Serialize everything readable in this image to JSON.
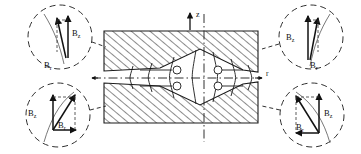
{
  "figure": {
    "axes": {
      "vertical_label": "z",
      "horizontal_label": "r"
    },
    "components": {
      "axial_label": "B",
      "axial_sub": "z",
      "radial_label": "B",
      "radial_sub": "r"
    },
    "callouts": [
      {
        "id": "top-left",
        "position": "upper-left pole tip",
        "axial_label": "B",
        "axial_sub": "z",
        "radial_label": "B",
        "radial_sub": "r"
      },
      {
        "id": "top-right",
        "position": "upper-right pole tip",
        "axial_label": "B",
        "axial_sub": "z",
        "radial_label": "B",
        "radial_sub": "r"
      },
      {
        "id": "bottom-left",
        "position": "lower-left pole tip",
        "axial_label": "B",
        "axial_sub": "z",
        "radial_label": "B",
        "radial_sub": "r"
      },
      {
        "id": "bottom-right",
        "position": "lower-right pole tip",
        "axial_label": "B",
        "axial_sub": "z",
        "radial_label": "B",
        "radial_sub": "r"
      }
    ],
    "colors": {
      "line": "#1a1a1a",
      "hatch": "#2b2b2b",
      "background": "#ffffff"
    }
  }
}
